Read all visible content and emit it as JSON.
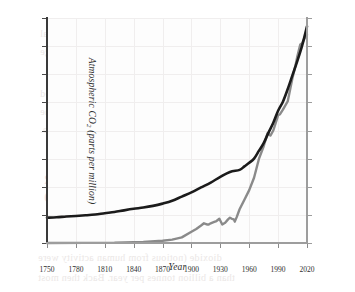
{
  "figure": {
    "background_color": "#fdfdfd",
    "grid_color": "#f0eeee",
    "scan_bleed_text": [
      "during CO2 from fossil fuel to industrial",
      "and from agriculture and land-use change",
      "to the warming of Earth's climate.",
      "emissions peaked, and more than doubled",
      "of our industrial history of the",
      "deforestation and agriculture.",
      "GREENHOUSE GAS EMISSIONS OVER",
      "THE SINCE 1950",
      "dioxide (notious from human activity were",
      "than a billion tonnes per year. Back then most"
    ]
  },
  "chart_data": {
    "type": "line",
    "title": "",
    "xlabel": "Year",
    "xlim": [
      1750,
      2020
    ],
    "xticks": [
      1750,
      1780,
      1810,
      1840,
      1870,
      1900,
      1930,
      1960,
      1990,
      2020
    ],
    "grid": true,
    "legend": "none",
    "axes": [
      {
        "id": "left",
        "label": "Atmospheric CO₂ (parts per million)",
        "label_plain_prefix": "Atmospheric CO",
        "label_sub": "2",
        "label_plain_suffix": " (parts per million)",
        "ylim": [
          260,
          420
        ],
        "yticks": [
          260,
          280,
          300,
          320,
          340,
          360,
          380,
          400,
          420
        ],
        "color": "#1b1b1b"
      },
      {
        "id": "right",
        "label": "CO₂ emissions (billions of tonnes)",
        "label_plain_prefix": "CO",
        "label_sub": "2",
        "label_plain_suffix": " emissions (billions of tonnes)",
        "ylim": [
          0,
          40
        ],
        "yticks": [
          0,
          5,
          10,
          15,
          20,
          25,
          30,
          35,
          40
        ],
        "color": "#8a8a8a"
      }
    ],
    "series": [
      {
        "name": "Atmospheric CO2",
        "axis": "left",
        "color": "#1b1b1b",
        "width": 2.6,
        "unit": "parts per million",
        "x": [
          1750,
          1760,
          1770,
          1780,
          1790,
          1800,
          1810,
          1820,
          1830,
          1840,
          1850,
          1860,
          1870,
          1880,
          1890,
          1900,
          1910,
          1920,
          1930,
          1940,
          1950,
          1955,
          1960,
          1965,
          1970,
          1975,
          1980,
          1985,
          1990,
          1995,
          2000,
          2005,
          2010,
          2015,
          2020
        ],
        "y": [
          278,
          278.3,
          278.8,
          279.2,
          279.7,
          280.3,
          281.2,
          282.0,
          283.2,
          284.3,
          285.2,
          286.4,
          288.0,
          290.0,
          293.0,
          296.0,
          299.5,
          303.0,
          307.0,
          310.5,
          312.0,
          314.5,
          317.0,
          320.0,
          325.5,
          331.0,
          338.5,
          345.5,
          354.0,
          360.5,
          369.5,
          379.5,
          389.5,
          400.5,
          414.0
        ]
      },
      {
        "name": "CO2 emissions",
        "axis": "right",
        "color": "#8a8a8a",
        "width": 2.4,
        "unit": "billions of tonnes",
        "x": [
          1750,
          1790,
          1820,
          1850,
          1870,
          1880,
          1890,
          1900,
          1905,
          1910,
          1913,
          1916,
          1918,
          1920,
          1923,
          1926,
          1929,
          1932,
          1935,
          1938,
          1940,
          1942,
          1944,
          1945,
          1947,
          1950,
          1955,
          1960,
          1965,
          1970,
          1975,
          1979,
          1982,
          1985,
          1990,
          1992,
          1995,
          2000,
          2005,
          2008,
          2010,
          2013,
          2015,
          2018,
          2020
        ],
        "y": [
          0.01,
          0.03,
          0.05,
          0.2,
          0.4,
          0.6,
          1.0,
          2.0,
          2.5,
          3.1,
          3.5,
          3.3,
          3.3,
          3.5,
          3.7,
          3.9,
          4.3,
          3.3,
          3.6,
          4.2,
          4.5,
          4.3,
          4.2,
          3.8,
          4.6,
          6.0,
          7.7,
          9.4,
          11.6,
          14.9,
          17.2,
          19.5,
          19.1,
          20.0,
          22.7,
          22.9,
          23.7,
          25.2,
          29.4,
          31.5,
          33.2,
          35.3,
          35.5,
          36.6,
          37.0
        ]
      }
    ],
    "annotations": {
      "crossover_year": 1967,
      "notable_dips": [
        "1918 (WWI)",
        "1932 (Great Depression)",
        "1945 (end of WWII)",
        "1982 (oil shock)"
      ]
    }
  }
}
